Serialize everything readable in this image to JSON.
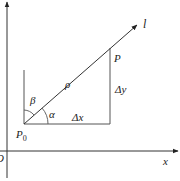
{
  "diagram": {
    "colors": {
      "stroke": "#333333",
      "text": "#222222",
      "background": "#ffffff"
    },
    "labels": {
      "origin": "O",
      "x_axis": "x",
      "ray": "l",
      "point_p": "P",
      "point_p0": "P",
      "point_p0_sub": "0",
      "rho": "ρ",
      "alpha": "α",
      "beta": "β",
      "delta_x": "Δx",
      "delta_y": "Δy"
    }
  }
}
